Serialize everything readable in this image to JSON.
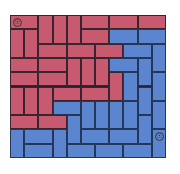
{
  "board": {
    "cols": 11,
    "rows": 10,
    "colors": {
      "red": "#c75a6e",
      "blue": "#5b86cf",
      "grid": "#3a2430"
    },
    "markers": [
      {
        "name": "red-start-marker",
        "col": 0,
        "row": 0,
        "glyph": "☉"
      },
      {
        "name": "blue-start-marker",
        "col": 10,
        "row": 8,
        "glyph": "☉"
      }
    ],
    "pieces": [
      {
        "c": 0,
        "r": 0,
        "w": 2,
        "h": 1,
        "color": "red"
      },
      {
        "c": 2,
        "r": 0,
        "w": 1,
        "h": 2,
        "color": "red"
      },
      {
        "c": 3,
        "r": 0,
        "w": 1,
        "h": 2,
        "color": "red"
      },
      {
        "c": 4,
        "r": 0,
        "w": 1,
        "h": 2,
        "color": "red"
      },
      {
        "c": 5,
        "r": 0,
        "w": 2,
        "h": 1,
        "color": "red"
      },
      {
        "c": 7,
        "r": 0,
        "w": 2,
        "h": 1,
        "color": "red"
      },
      {
        "c": 9,
        "r": 0,
        "w": 2,
        "h": 1,
        "color": "red"
      },
      {
        "c": 0,
        "r": 1,
        "w": 1,
        "h": 2,
        "color": "red"
      },
      {
        "c": 1,
        "r": 1,
        "w": 1,
        "h": 2,
        "color": "red"
      },
      {
        "c": 5,
        "r": 1,
        "w": 2,
        "h": 1,
        "color": "red"
      },
      {
        "c": 7,
        "r": 1,
        "w": 2,
        "h": 1,
        "color": "blue"
      },
      {
        "c": 9,
        "r": 1,
        "w": 2,
        "h": 1,
        "color": "blue"
      },
      {
        "c": 2,
        "r": 2,
        "w": 2,
        "h": 1,
        "color": "red"
      },
      {
        "c": 4,
        "r": 2,
        "w": 2,
        "h": 1,
        "color": "red"
      },
      {
        "c": 6,
        "r": 2,
        "w": 2,
        "h": 1,
        "color": "red"
      },
      {
        "c": 8,
        "r": 2,
        "w": 2,
        "h": 1,
        "color": "blue"
      },
      {
        "c": 10,
        "r": 2,
        "w": 1,
        "h": 2,
        "color": "blue"
      },
      {
        "c": 0,
        "r": 3,
        "w": 2,
        "h": 1,
        "color": "red"
      },
      {
        "c": 2,
        "r": 3,
        "w": 2,
        "h": 1,
        "color": "red"
      },
      {
        "c": 4,
        "r": 3,
        "w": 1,
        "h": 2,
        "color": "red"
      },
      {
        "c": 5,
        "r": 3,
        "w": 1,
        "h": 2,
        "color": "red"
      },
      {
        "c": 6,
        "r": 3,
        "w": 1,
        "h": 2,
        "color": "red"
      },
      {
        "c": 7,
        "r": 3,
        "w": 2,
        "h": 1,
        "color": "blue"
      },
      {
        "c": 9,
        "r": 3,
        "w": 1,
        "h": 2,
        "color": "blue"
      },
      {
        "c": 0,
        "r": 4,
        "w": 2,
        "h": 1,
        "color": "red"
      },
      {
        "c": 2,
        "r": 4,
        "w": 2,
        "h": 1,
        "color": "red"
      },
      {
        "c": 7,
        "r": 4,
        "w": 1,
        "h": 2,
        "color": "red"
      },
      {
        "c": 8,
        "r": 4,
        "w": 1,
        "h": 2,
        "color": "blue"
      },
      {
        "c": 10,
        "r": 4,
        "w": 1,
        "h": 2,
        "color": "blue"
      },
      {
        "c": 0,
        "r": 5,
        "w": 1,
        "h": 2,
        "color": "red"
      },
      {
        "c": 1,
        "r": 5,
        "w": 1,
        "h": 2,
        "color": "red"
      },
      {
        "c": 2,
        "r": 5,
        "w": 1,
        "h": 2,
        "color": "red"
      },
      {
        "c": 3,
        "r": 5,
        "w": 2,
        "h": 1,
        "color": "red"
      },
      {
        "c": 5,
        "r": 5,
        "w": 2,
        "h": 1,
        "color": "red"
      },
      {
        "c": 9,
        "r": 5,
        "w": 1,
        "h": 2,
        "color": "blue"
      },
      {
        "c": 3,
        "r": 6,
        "w": 2,
        "h": 1,
        "color": "blue"
      },
      {
        "c": 5,
        "r": 6,
        "w": 1,
        "h": 2,
        "color": "blue"
      },
      {
        "c": 6,
        "r": 6,
        "w": 1,
        "h": 2,
        "color": "blue"
      },
      {
        "c": 7,
        "r": 6,
        "w": 1,
        "h": 2,
        "color": "blue"
      },
      {
        "c": 8,
        "r": 6,
        "w": 1,
        "h": 2,
        "color": "blue"
      },
      {
        "c": 10,
        "r": 6,
        "w": 1,
        "h": 2,
        "color": "blue"
      },
      {
        "c": 0,
        "r": 7,
        "w": 2,
        "h": 1,
        "color": "red"
      },
      {
        "c": 2,
        "r": 7,
        "w": 2,
        "h": 1,
        "color": "red"
      },
      {
        "c": 4,
        "r": 7,
        "w": 1,
        "h": 2,
        "color": "blue"
      },
      {
        "c": 9,
        "r": 7,
        "w": 1,
        "h": 2,
        "color": "blue"
      },
      {
        "c": 0,
        "r": 8,
        "w": 1,
        "h": 2,
        "color": "blue"
      },
      {
        "c": 1,
        "r": 8,
        "w": 2,
        "h": 1,
        "color": "blue"
      },
      {
        "c": 3,
        "r": 8,
        "w": 1,
        "h": 2,
        "color": "blue"
      },
      {
        "c": 5,
        "r": 8,
        "w": 2,
        "h": 1,
        "color": "blue"
      },
      {
        "c": 7,
        "r": 8,
        "w": 2,
        "h": 1,
        "color": "blue"
      },
      {
        "c": 10,
        "r": 8,
        "w": 1,
        "h": 2,
        "color": "blue"
      },
      {
        "c": 1,
        "r": 9,
        "w": 2,
        "h": 1,
        "color": "blue"
      },
      {
        "c": 4,
        "r": 9,
        "w": 2,
        "h": 1,
        "color": "blue"
      },
      {
        "c": 6,
        "r": 9,
        "w": 2,
        "h": 1,
        "color": "blue"
      },
      {
        "c": 8,
        "r": 9,
        "w": 2,
        "h": 1,
        "color": "blue"
      }
    ]
  }
}
